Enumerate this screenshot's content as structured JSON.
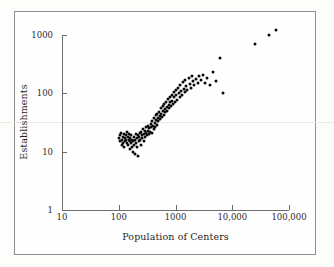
{
  "figure": {
    "type": "scatter-plot-log-log",
    "background_color": "#fdfdfc",
    "frame_color": "#8e8e8e",
    "point_color": "#0a0a0a",
    "axis_color": "#6d6d6d"
  },
  "chart_data": {
    "type": "scatter",
    "title": "",
    "xlabel": "Population of Centers",
    "ylabel": "Establishments",
    "xscale": "log",
    "yscale": "log",
    "xlim": [
      10,
      100000
    ],
    "ylim": [
      1,
      3000
    ],
    "grid": false,
    "legend": null,
    "xticks": [
      {
        "value": 10,
        "label": "10"
      },
      {
        "value": 100,
        "label": "100"
      },
      {
        "value": 1000,
        "label": "1000"
      },
      {
        "value": 10000,
        "label": "10,000"
      },
      {
        "value": 100000,
        "label": "100,000"
      }
    ],
    "yticks": [
      {
        "value": 1,
        "label": "1"
      },
      {
        "value": 10,
        "label": "10"
      },
      {
        "value": 100,
        "label": "100"
      },
      {
        "value": 1000,
        "label": "1000"
      }
    ],
    "n_points": 132,
    "points": [
      [
        100,
        17
      ],
      [
        104,
        19
      ],
      [
        107,
        15
      ],
      [
        110,
        21
      ],
      [
        112,
        13
      ],
      [
        115,
        16
      ],
      [
        118,
        18
      ],
      [
        120,
        14
      ],
      [
        122,
        20
      ],
      [
        125,
        12
      ],
      [
        128,
        17
      ],
      [
        130,
        15
      ],
      [
        133,
        19
      ],
      [
        136,
        16
      ],
      [
        138,
        22
      ],
      [
        140,
        14
      ],
      [
        143,
        18
      ],
      [
        146,
        13
      ],
      [
        150,
        16
      ],
      [
        152,
        20
      ],
      [
        155,
        15
      ],
      [
        158,
        11
      ],
      [
        160,
        17
      ],
      [
        163,
        14
      ],
      [
        166,
        19
      ],
      [
        170,
        12
      ],
      [
        173,
        16
      ],
      [
        176,
        10
      ],
      [
        180,
        15
      ],
      [
        184,
        18
      ],
      [
        188,
        13
      ],
      [
        192,
        9
      ],
      [
        196,
        16
      ],
      [
        200,
        20
      ],
      [
        204,
        14
      ],
      [
        208,
        17
      ],
      [
        212,
        12
      ],
      [
        216,
        19
      ],
      [
        220,
        8.5
      ],
      [
        225,
        15
      ],
      [
        230,
        18
      ],
      [
        235,
        21
      ],
      [
        240,
        16
      ],
      [
        245,
        13
      ],
      [
        250,
        22
      ],
      [
        256,
        19
      ],
      [
        262,
        17
      ],
      [
        268,
        24
      ],
      [
        274,
        20
      ],
      [
        280,
        15
      ],
      [
        286,
        23
      ],
      [
        292,
        18
      ],
      [
        300,
        26
      ],
      [
        308,
        21
      ],
      [
        315,
        19
      ],
      [
        322,
        28
      ],
      [
        330,
        23
      ],
      [
        338,
        20
      ],
      [
        346,
        25
      ],
      [
        355,
        22
      ],
      [
        364,
        30
      ],
      [
        373,
        26
      ],
      [
        382,
        21
      ],
      [
        392,
        33
      ],
      [
        400,
        28
      ],
      [
        410,
        24
      ],
      [
        420,
        38
      ],
      [
        430,
        31
      ],
      [
        440,
        27
      ],
      [
        450,
        42
      ],
      [
        460,
        35
      ],
      [
        470,
        29
      ],
      [
        480,
        45
      ],
      [
        490,
        38
      ],
      [
        500,
        33
      ],
      [
        512,
        48
      ],
      [
        524,
        41
      ],
      [
        536,
        36
      ],
      [
        548,
        55
      ],
      [
        560,
        44
      ],
      [
        575,
        39
      ],
      [
        590,
        60
      ],
      [
        605,
        50
      ],
      [
        620,
        43
      ],
      [
        635,
        65
      ],
      [
        650,
        54
      ],
      [
        666,
        47
      ],
      [
        682,
        72
      ],
      [
        700,
        58
      ],
      [
        718,
        50
      ],
      [
        736,
        80
      ],
      [
        755,
        63
      ],
      [
        774,
        55
      ],
      [
        794,
        88
      ],
      [
        814,
        70
      ],
      [
        835,
        60
      ],
      [
        856,
        95
      ],
      [
        878,
        75
      ],
      [
        900,
        66
      ],
      [
        925,
        105
      ],
      [
        950,
        85
      ],
      [
        975,
        72
      ],
      [
        1000,
        115
      ],
      [
        1030,
        92
      ],
      [
        1060,
        78
      ],
      [
        1100,
        125
      ],
      [
        1140,
        100
      ],
      [
        1180,
        86
      ],
      [
        1220,
        140
      ],
      [
        1260,
        110
      ],
      [
        1300,
        95
      ],
      [
        1350,
        155
      ],
      [
        1400,
        120
      ],
      [
        1450,
        104
      ],
      [
        1500,
        170
      ],
      [
        1560,
        132
      ],
      [
        1620,
        112
      ],
      [
        1700,
        185
      ],
      [
        1780,
        145
      ],
      [
        1860,
        125
      ],
      [
        1950,
        200
      ],
      [
        2050,
        160
      ],
      [
        2150,
        138
      ],
      [
        2300,
        175
      ],
      [
        2450,
        152
      ],
      [
        2600,
        195
      ],
      [
        2800,
        168
      ],
      [
        3000,
        210
      ],
      [
        3300,
        150
      ],
      [
        3600,
        185
      ],
      [
        4000,
        140
      ],
      [
        4500,
        230
      ],
      [
        5200,
        165
      ],
      [
        6000,
        400
      ],
      [
        6800,
        100
      ],
      [
        25000,
        700
      ],
      [
        45000,
        1000
      ],
      [
        60000,
        1200
      ]
    ]
  }
}
